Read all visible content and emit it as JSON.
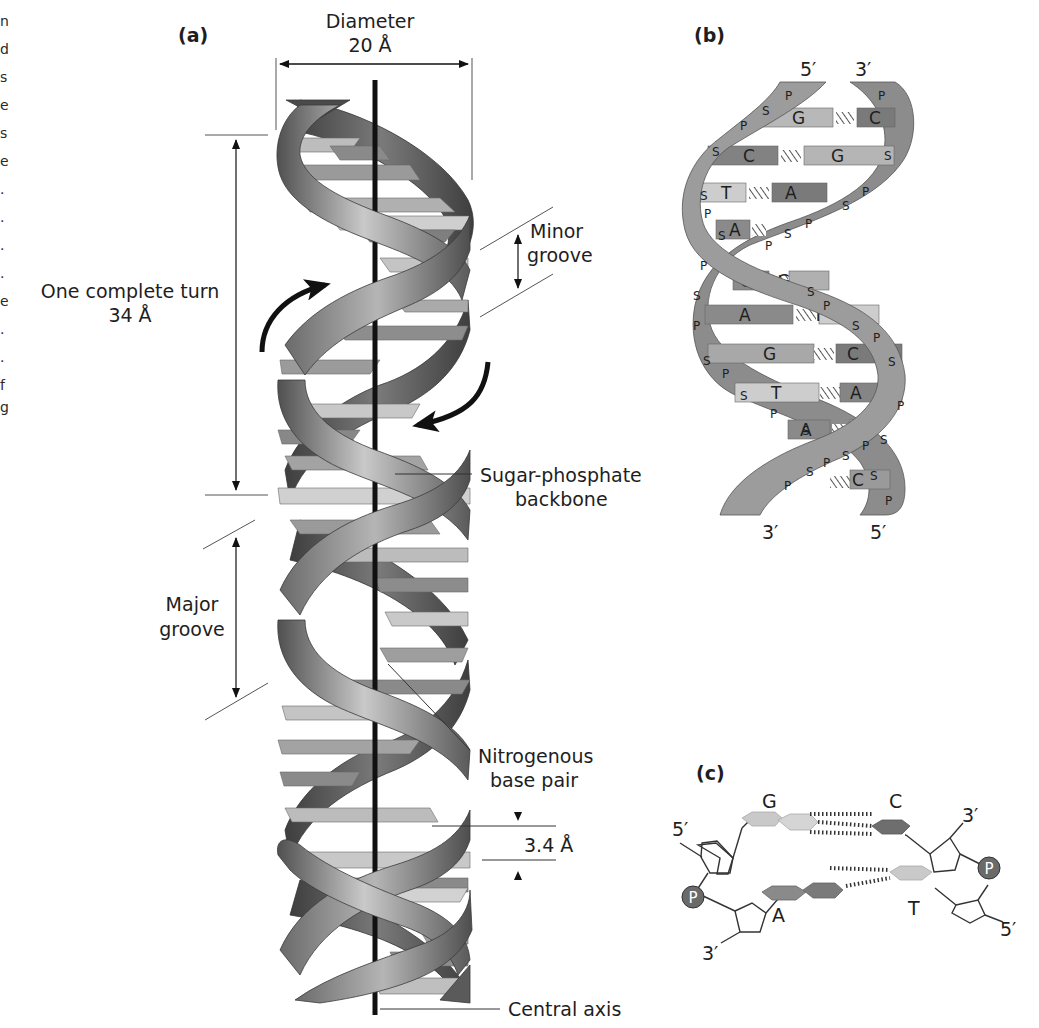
{
  "figure": {
    "left_margin_fragments": [
      "n",
      "d",
      "s",
      "e",
      "s",
      "e",
      ".",
      ".",
      ".",
      ".",
      "e",
      ".",
      ".",
      "f",
      "g"
    ],
    "panel_a": {
      "label": "(a)",
      "diameter_title": "Diameter",
      "diameter_value": "20 Å",
      "turn_title": "One complete turn",
      "turn_value": "34 Å",
      "minor_groove_line1": "Minor",
      "minor_groove_line2": "groove",
      "backbone_line1": "Sugar-phosphate",
      "backbone_line2": "backbone",
      "major_groove_line1": "Major",
      "major_groove_line2": "groove",
      "base_pair_line1": "Nitrogenous",
      "base_pair_line2": "base pair",
      "rise_value": "3.4 Å",
      "axis_label": "Central axis"
    },
    "panel_b": {
      "label": "(b)",
      "top_left_end": "5′",
      "top_right_end": "3′",
      "bottom_left_end": "3′",
      "bottom_right_end": "5′",
      "base_pairs": [
        {
          "left": "G",
          "right": "C"
        },
        {
          "left": "C",
          "right": "G"
        },
        {
          "left": "T",
          "right": "A"
        },
        {
          "left": "A",
          "right": "T"
        },
        {
          "left": "C",
          "right": "G"
        },
        {
          "left": "A",
          "right": "T"
        },
        {
          "left": "G",
          "right": "C"
        },
        {
          "left": "T",
          "right": "A"
        },
        {
          "left": "A",
          "right": "T"
        },
        {
          "left": "G",
          "right": "C"
        }
      ],
      "sugar": "S",
      "phosphate": "P"
    },
    "panel_c": {
      "label": "(c)",
      "top_pair_left": "G",
      "top_pair_right": "C",
      "bottom_pair_left": "A",
      "bottom_pair_right": "T",
      "end_top_left": "5′",
      "end_top_right": "3′",
      "end_bottom_left": "3′",
      "end_bottom_right": "5′",
      "phosphate": "P"
    },
    "colors": {
      "ribbon_dark": "#4a4a4a",
      "ribbon_mid": "#8a8a8a",
      "ribbon_light": "#c8c8c8",
      "base_dark": "#7a7a7a",
      "base_mid": "#a8a8a8",
      "base_light": "#d4d4d4",
      "axis": "#111111"
    }
  }
}
